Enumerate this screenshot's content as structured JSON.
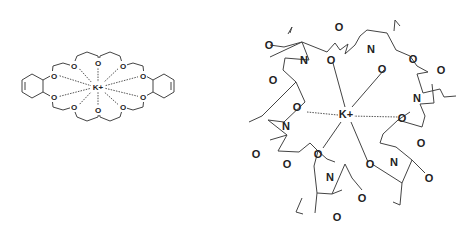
{
  "figure": {
    "left_structure": {
      "name": "dibenzo-crown ether potassium complex",
      "central_ion": "K+",
      "oxygen_label": "O",
      "oxygen_count": 10,
      "benzene_rings": 2
    },
    "right_structure": {
      "name": "valinomycin potassium complex",
      "central_ion": "K+",
      "oxygen_label": "O",
      "nitrogen_label": "N"
    }
  }
}
